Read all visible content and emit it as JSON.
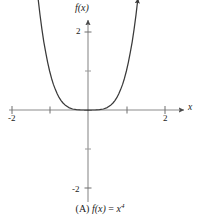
{
  "figure": {
    "caption_prefix": "(A)",
    "caption_function_name": "f",
    "caption_variable": "(x)",
    "caption_equals": "=",
    "caption_base": "x",
    "caption_exponent": "4",
    "caption_full": "(A) f(x) = x4",
    "axis_color": "#8c8c8c",
    "curve_color": "#3a3a3a",
    "text_color": "#1a1a1a",
    "background_color": "#ffffff"
  },
  "axes": {
    "y_axis_label": "f(x)",
    "x_axis_label": "x",
    "x_tick_labels": [
      "-2",
      "2"
    ],
    "y_tick_labels": [
      "2",
      "-2"
    ],
    "x_ticks_values": [
      -2,
      -1,
      1,
      2
    ],
    "y_ticks_values": [
      2,
      1,
      -1,
      -2
    ],
    "xlim": [
      -2.35,
      2.5
    ],
    "ylim": [
      -2.35,
      2.5
    ]
  },
  "chart_data": {
    "type": "line",
    "title": "",
    "subtitle": "",
    "xlabel": "x",
    "ylabel": "f(x)",
    "equation": "f(x) = x^4",
    "xlim": [
      -2.35,
      2.5
    ],
    "ylim": [
      -2.35,
      2.5
    ],
    "grid": false,
    "legend": null,
    "x_tick_labels": [
      "-2",
      "2"
    ],
    "y_tick_labels": [
      "2",
      "-2"
    ],
    "x_ticks": [
      -2,
      -1,
      1,
      2
    ],
    "y_ticks": [
      -2,
      -1,
      1,
      2
    ],
    "arrow_axes": true,
    "curve_arrow_ends": true,
    "series": [
      {
        "name": "f(x) = x^4",
        "x": [
          -1.3,
          -1.25,
          -1.2,
          -1.15,
          -1.1,
          -1.05,
          -1.0,
          -0.95,
          -0.9,
          -0.85,
          -0.8,
          -0.75,
          -0.7,
          -0.65,
          -0.6,
          -0.5,
          -0.4,
          -0.3,
          -0.2,
          -0.1,
          0.0,
          0.1,
          0.2,
          0.3,
          0.4,
          0.5,
          0.6,
          0.65,
          0.7,
          0.75,
          0.8,
          0.85,
          0.9,
          0.95,
          1.0,
          1.05,
          1.1,
          1.15,
          1.2,
          1.25,
          1.3
        ],
        "y": [
          2.8561,
          2.4414,
          2.0736,
          1.749,
          1.4641,
          1.2155,
          1.0,
          0.8145,
          0.6561,
          0.522,
          0.4096,
          0.3164,
          0.2401,
          0.1785,
          0.1296,
          0.0625,
          0.0256,
          0.0081,
          0.0016,
          0.0001,
          0.0,
          0.0001,
          0.0016,
          0.0081,
          0.0256,
          0.0625,
          0.1296,
          0.1785,
          0.2401,
          0.3164,
          0.4096,
          0.522,
          0.6561,
          0.8145,
          1.0,
          1.2155,
          1.4641,
          1.749,
          2.0736,
          2.4414,
          2.8561
        ]
      }
    ]
  }
}
